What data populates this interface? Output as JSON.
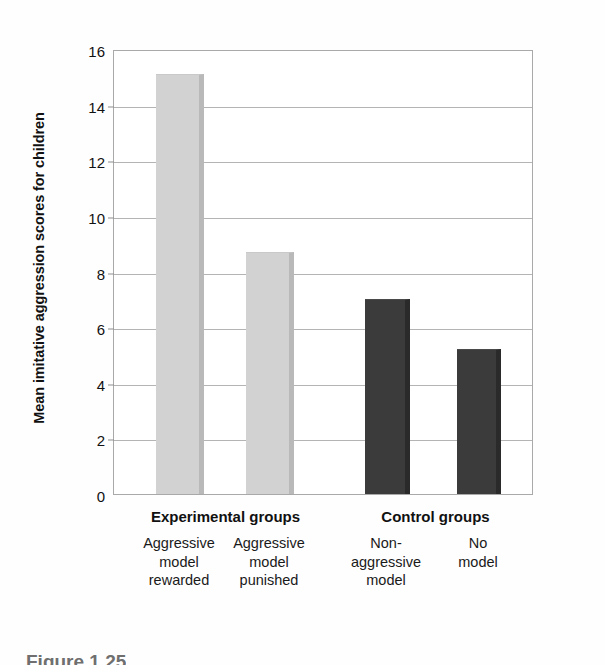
{
  "chart_data": {
    "type": "bar",
    "title": "",
    "xlabel": "",
    "ylabel": "Mean imitative aggression scores for children",
    "ylim": [
      0,
      16
    ],
    "ytick_step": 2,
    "yticks": [
      0,
      2,
      4,
      6,
      8,
      10,
      12,
      14,
      16
    ],
    "ytick_labels": [
      "0",
      "2",
      "4",
      "6",
      "8",
      "10",
      "12",
      "14",
      "16"
    ],
    "grid": true,
    "grid_axis": "y",
    "legend": "none",
    "categories": [
      "Aggressive model rewarded",
      "Aggressive model punished",
      "Non-aggressive model",
      "No model"
    ],
    "values": [
      15.1,
      8.7,
      7.0,
      5.2
    ],
    "bar_colors": [
      "#d2d2d2",
      "#d2d2d2",
      "#3b3b3b",
      "#3b3b3b"
    ],
    "groups": [
      {
        "label": "Experimental groups",
        "categories": [
          0,
          1
        ]
      },
      {
        "label": "Control groups",
        "categories": [
          2,
          3
        ]
      }
    ]
  },
  "axis": {
    "y_title": "Mean imitative aggression scores for children"
  },
  "bars": [
    {
      "name": "aggressive-model-rewarded",
      "value": 15.1,
      "color": "#d2d2d2",
      "shade": "light",
      "label_lines": [
        "Aggressive",
        "model",
        "rewarded"
      ]
    },
    {
      "name": "aggressive-model-punished",
      "value": 8.7,
      "color": "#d2d2d2",
      "shade": "light",
      "label_lines": [
        "Aggressive",
        "model",
        "punished"
      ]
    },
    {
      "name": "non-aggressive-model",
      "value": 7.0,
      "color": "#3b3b3b",
      "shade": "dark",
      "label_lines": [
        "Non-",
        "aggressive",
        "model"
      ]
    },
    {
      "name": "no-model",
      "value": 5.2,
      "color": "#3b3b3b",
      "shade": "dark",
      "label_lines": [
        "No",
        "model"
      ]
    }
  ],
  "groups": [
    {
      "label": "Experimental groups"
    },
    {
      "label": "Control groups"
    }
  ],
  "caption": "Figure 1.25"
}
